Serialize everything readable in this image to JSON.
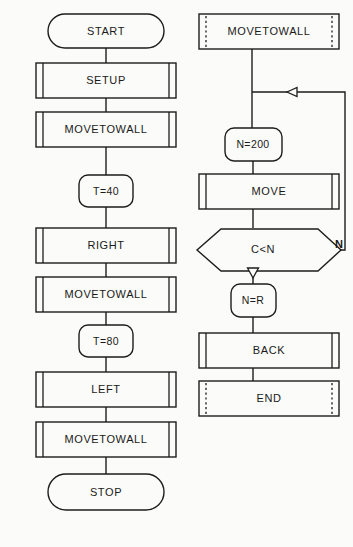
{
  "diagram": {
    "background_color": "#fbfbf9",
    "line_color": "#1d1d1b",
    "text_color": "#1a1a18"
  },
  "left_column": {
    "nodes": [
      {
        "id": "start",
        "label": "START",
        "shape": "terminator"
      },
      {
        "id": "setup",
        "label": "SETUP",
        "shape": "predefined-process"
      },
      {
        "id": "movetowall_1",
        "label": "MOVETOWALL",
        "shape": "predefined-process"
      },
      {
        "id": "t40",
        "label": "T=40",
        "shape": "rounded-box"
      },
      {
        "id": "right",
        "label": "RIGHT",
        "shape": "predefined-process"
      },
      {
        "id": "movetowall_2",
        "label": "MOVETOWALL",
        "shape": "predefined-process"
      },
      {
        "id": "t80",
        "label": "T=80",
        "shape": "rounded-box"
      },
      {
        "id": "left",
        "label": "LEFT",
        "shape": "predefined-process"
      },
      {
        "id": "movetowall_3",
        "label": "MOVETOWALL",
        "shape": "predefined-process"
      },
      {
        "id": "stop",
        "label": "STOP",
        "shape": "terminator"
      }
    ]
  },
  "right_column": {
    "nodes": [
      {
        "id": "movetowall_4",
        "label": "MOVETOWALL",
        "shape": "predefined-process-dashed"
      },
      {
        "id": "n200",
        "label": "N=200",
        "shape": "rounded-box"
      },
      {
        "id": "move",
        "label": "MOVE",
        "shape": "predefined-process"
      },
      {
        "id": "cltn",
        "label": "C<N",
        "shape": "decision"
      },
      {
        "id": "nr",
        "label": "N=R",
        "shape": "rounded-box"
      },
      {
        "id": "back",
        "label": "BACK",
        "shape": "predefined-process"
      },
      {
        "id": "end",
        "label": "END",
        "shape": "predefined-process-dashed"
      }
    ],
    "branch_labels": [
      {
        "id": "no-branch",
        "label": "N",
        "from": "cltn",
        "side": "right"
      }
    ]
  }
}
